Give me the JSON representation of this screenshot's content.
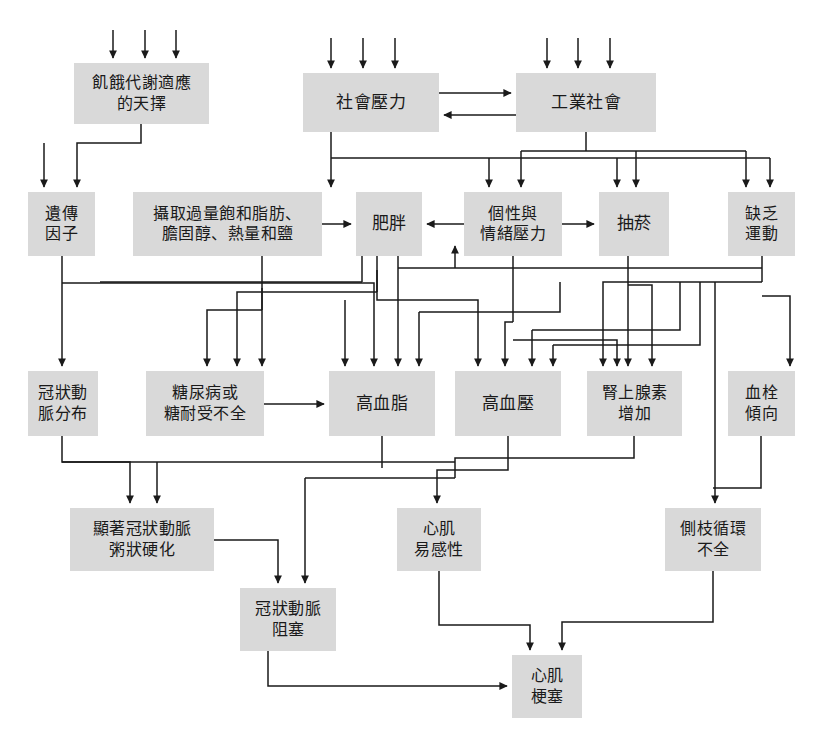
{
  "diagram": {
    "title": "",
    "type": "flowchart",
    "language": "zh-Hant",
    "colors": {
      "node_fill": "#d9d9d9",
      "node_text": "#1a1a1a",
      "edge": "#1a1a1a",
      "background": "#ffffff"
    },
    "nodes": [
      {
        "id": "n1",
        "label": "飢餓代謝適應\n的天擇",
        "x": 74,
        "y": 63,
        "w": 135,
        "h": 61,
        "font": "f16"
      },
      {
        "id": "n2",
        "label": "社會壓力",
        "x": 303,
        "y": 73,
        "w": 136,
        "h": 59,
        "font": "f17"
      },
      {
        "id": "n3",
        "label": "工業社會",
        "x": 516,
        "y": 73,
        "w": 140,
        "h": 59,
        "font": "f17"
      },
      {
        "id": "n4",
        "label": "遺傳\n因子",
        "x": 28,
        "y": 192,
        "w": 67,
        "h": 64,
        "font": "f16"
      },
      {
        "id": "n5",
        "label": "攝取過量飽和脂肪、\n膽固醇、熱量和鹽",
        "x": 133,
        "y": 192,
        "w": 189,
        "h": 64,
        "font": "f16"
      },
      {
        "id": "n6",
        "label": "肥胖",
        "x": 356,
        "y": 192,
        "w": 66,
        "h": 64,
        "font": "f17"
      },
      {
        "id": "n7",
        "label": "個性與\n情緒壓力",
        "x": 464,
        "y": 192,
        "w": 98,
        "h": 64,
        "font": "f16"
      },
      {
        "id": "n8",
        "label": "抽菸",
        "x": 599,
        "y": 192,
        "w": 70,
        "h": 64,
        "font": "f17"
      },
      {
        "id": "n9",
        "label": "缺乏\n運動",
        "x": 728,
        "y": 192,
        "w": 67,
        "h": 64,
        "font": "f16"
      },
      {
        "id": "n10",
        "label": "冠狀動\n脈分布",
        "x": 28,
        "y": 371,
        "w": 70,
        "h": 65,
        "font": "f16"
      },
      {
        "id": "n11",
        "label": "糖尿病或\n糖耐受不全",
        "x": 146,
        "y": 371,
        "w": 118,
        "h": 65,
        "font": "f16"
      },
      {
        "id": "n12",
        "label": "高血脂",
        "x": 329,
        "y": 371,
        "w": 106,
        "h": 65,
        "font": "f17"
      },
      {
        "id": "n13",
        "label": "高血壓",
        "x": 455,
        "y": 371,
        "w": 106,
        "h": 65,
        "font": "f17"
      },
      {
        "id": "n14",
        "label": "腎上腺素\n增加",
        "x": 587,
        "y": 371,
        "w": 95,
        "h": 65,
        "font": "f16"
      },
      {
        "id": "n15",
        "label": "血栓\n傾向",
        "x": 728,
        "y": 371,
        "w": 67,
        "h": 65,
        "font": "f16"
      },
      {
        "id": "n16",
        "label": "顯著冠狀動脈\n粥狀硬化",
        "x": 70,
        "y": 508,
        "w": 144,
        "h": 63,
        "font": "f16"
      },
      {
        "id": "n17",
        "label": "心肌\n易感性",
        "x": 397,
        "y": 508,
        "w": 84,
        "h": 63,
        "font": "f16"
      },
      {
        "id": "n18",
        "label": "側枝循環\n不全",
        "x": 665,
        "y": 508,
        "w": 96,
        "h": 63,
        "font": "f16"
      },
      {
        "id": "n19",
        "label": "冠狀動脈\n阻塞",
        "x": 240,
        "y": 588,
        "w": 96,
        "h": 63,
        "font": "f16"
      },
      {
        "id": "n20",
        "label": "心肌\n梗塞",
        "x": 512,
        "y": 655,
        "w": 70,
        "h": 63,
        "font": "f16"
      }
    ],
    "external_inputs": [
      {
        "target": "n1",
        "count": 3,
        "arrow_x": [
          113,
          145,
          176
        ]
      },
      {
        "target": "n2",
        "count": 3,
        "arrow_x": [
          331,
          363,
          395
        ]
      },
      {
        "target": "n3",
        "count": 3,
        "arrow_x": [
          547,
          578,
          610
        ]
      },
      {
        "target": "n4",
        "count": 1,
        "arrow_x": [
          44
        ]
      }
    ],
    "edges": [
      {
        "from": "n2",
        "to": "n3",
        "label": ""
      },
      {
        "from": "n3",
        "to": "n2",
        "label": ""
      },
      {
        "from": "n1",
        "to": "n4",
        "label": ""
      },
      {
        "from": "n2",
        "to": "n6",
        "label": ""
      },
      {
        "from": "n2",
        "to": "n7",
        "label": ""
      },
      {
        "from": "n2",
        "to": "n8",
        "label": ""
      },
      {
        "from": "n2",
        "to": "n9",
        "label": ""
      },
      {
        "from": "n3",
        "to": "n7",
        "label": ""
      },
      {
        "from": "n3",
        "to": "n8",
        "label": ""
      },
      {
        "from": "n3",
        "to": "n9",
        "label": ""
      },
      {
        "from": "n5",
        "to": "n6",
        "label": ""
      },
      {
        "from": "n7",
        "to": "n6",
        "label": ""
      },
      {
        "from": "n7",
        "to": "n8",
        "label": ""
      },
      {
        "from": "n4",
        "to": "n10",
        "label": ""
      },
      {
        "from": "n4",
        "to": "n12",
        "label": ""
      },
      {
        "from": "n5",
        "to": "n11",
        "label": ""
      },
      {
        "from": "n5",
        "to": "n12",
        "label": ""
      },
      {
        "from": "n6",
        "to": "n11",
        "label": ""
      },
      {
        "from": "n6",
        "to": "n12",
        "label": ""
      },
      {
        "from": "n6",
        "to": "n13",
        "label": ""
      },
      {
        "from": "n7",
        "to": "n13",
        "label": ""
      },
      {
        "from": "n7",
        "to": "n14",
        "label": ""
      },
      {
        "from": "n8",
        "to": "n12",
        "label": ""
      },
      {
        "from": "n8",
        "to": "n14",
        "label": ""
      },
      {
        "from": "n9",
        "to": "n6",
        "label": ""
      },
      {
        "from": "n9",
        "to": "n12",
        "label": ""
      },
      {
        "from": "n9",
        "to": "n15",
        "label": ""
      },
      {
        "from": "n11",
        "to": "n12",
        "label": ""
      },
      {
        "from": "n10",
        "to": "n16",
        "label": ""
      },
      {
        "from": "n12",
        "to": "n16",
        "label": ""
      },
      {
        "from": "n12",
        "to": "n19",
        "label": ""
      },
      {
        "from": "n13",
        "to": "n17",
        "label": ""
      },
      {
        "from": "n14",
        "to": "n17",
        "label": ""
      },
      {
        "from": "n15",
        "to": "n18",
        "label": ""
      },
      {
        "from": "n9",
        "to": "n18",
        "label": ""
      },
      {
        "from": "n16",
        "to": "n19",
        "label": ""
      },
      {
        "from": "n17",
        "to": "n20",
        "label": ""
      },
      {
        "from": "n18",
        "to": "n20",
        "label": ""
      },
      {
        "from": "n19",
        "to": "n20",
        "label": ""
      }
    ]
  }
}
